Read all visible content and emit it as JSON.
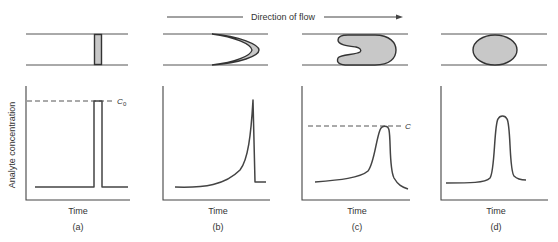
{
  "figure": {
    "flow_direction_label": "Direction of flow",
    "y_axis_label": "Analyte concentration",
    "x_axis_label": "Time",
    "colors": {
      "line": "#444444",
      "plug_fill": "#c8c8c8",
      "background": "#ffffff"
    },
    "panels": [
      {
        "id": "a",
        "caption": "(a)",
        "x_label": "Time",
        "plug_shape": "thin rectangle",
        "reference_line": {
          "label": "C",
          "subscript": "0"
        },
        "profile": "square pulse"
      },
      {
        "id": "b",
        "caption": "(b)",
        "x_label": "Time",
        "plug_shape": "parabolic crescent",
        "profile": "sharp rise then abrupt drop (tailing front)"
      },
      {
        "id": "c",
        "caption": "(c)",
        "x_label": "Time",
        "plug_shape": "U-shaped plug",
        "reference_line": {
          "label": "C",
          "subscript": ""
        },
        "profile": "asymmetric peak"
      },
      {
        "id": "d",
        "caption": "(d)",
        "x_label": "Time",
        "plug_shape": "ellipse",
        "profile": "near-Gaussian peak"
      }
    ]
  }
}
